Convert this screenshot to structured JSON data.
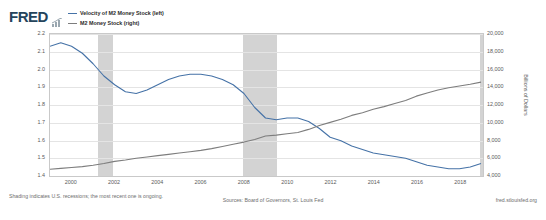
{
  "brand": {
    "logo_text": "FRED",
    "mark_icon": "bar-chart-icon"
  },
  "legend": {
    "position": "top-left",
    "items": [
      {
        "label": "Velocity of M2 Money Stock (left)",
        "color": "#4572a7"
      },
      {
        "label": "M2 Money Stock (right)",
        "color": "#7d7d7d"
      }
    ]
  },
  "footer": {
    "note": "Shading indicates U.S. recessions; the most recent one is ongoing.",
    "sources": "Sources: Board of Governors, St. Louis Fed",
    "url": "fred.stlouisfed.org"
  },
  "chart_data": {
    "type": "line",
    "title": "",
    "xlabel": "",
    "grid": true,
    "xlim": [
      1999.0,
      2019.0
    ],
    "x_ticks": [
      "2000",
      "2002",
      "2004",
      "2006",
      "2008",
      "2010",
      "2012",
      "2014",
      "2016",
      "2018"
    ],
    "x_tick_values": [
      2000,
      2002,
      2004,
      2006,
      2008,
      2010,
      2012,
      2014,
      2016,
      2018
    ],
    "axes": [
      {
        "side": "left",
        "ylabel": "Ratio",
        "ylim": [
          1.4,
          2.2
        ],
        "ticks": [
          "2.2",
          "2.1",
          "2.0",
          "1.9",
          "1.8",
          "1.7",
          "1.6",
          "1.5",
          "1.4"
        ],
        "tick_values": [
          2.2,
          2.1,
          2.0,
          1.9,
          1.8,
          1.7,
          1.6,
          1.5,
          1.4
        ]
      },
      {
        "side": "right",
        "ylabel": "Billions of Dollars",
        "ylim": [
          4000,
          20000
        ],
        "ticks": [
          "20,000",
          "18,000",
          "16,000",
          "14,000",
          "12,000",
          "10,000",
          "8,000",
          "6,000",
          "4,000"
        ],
        "tick_values": [
          20000,
          18000,
          16000,
          14000,
          12000,
          10000,
          8000,
          6000,
          4000
        ]
      }
    ],
    "series": [
      {
        "name": "Velocity of M2 Money Stock (left)",
        "axis": "left",
        "color": "#4572a7",
        "x": [
          1999.0,
          1999.5,
          2000.0,
          2000.5,
          2001.0,
          2001.5,
          2002.0,
          2002.5,
          2003.0,
          2003.5,
          2004.0,
          2004.5,
          2005.0,
          2005.5,
          2006.0,
          2006.5,
          2007.0,
          2007.5,
          2008.0,
          2008.5,
          2009.0,
          2009.5,
          2010.0,
          2010.5,
          2011.0,
          2011.5,
          2012.0,
          2012.5,
          2013.0,
          2013.5,
          2014.0,
          2014.5,
          2015.0,
          2015.5,
          2016.0,
          2016.5,
          2017.0,
          2017.5,
          2018.0,
          2018.5,
          2019.0
        ],
        "y": [
          2.13,
          2.15,
          2.13,
          2.09,
          2.03,
          1.96,
          1.91,
          1.87,
          1.86,
          1.88,
          1.91,
          1.94,
          1.96,
          1.97,
          1.97,
          1.96,
          1.94,
          1.91,
          1.86,
          1.78,
          1.72,
          1.71,
          1.72,
          1.72,
          1.7,
          1.66,
          1.61,
          1.59,
          1.56,
          1.54,
          1.52,
          1.51,
          1.5,
          1.49,
          1.47,
          1.45,
          1.44,
          1.43,
          1.43,
          1.44,
          1.46
        ]
      },
      {
        "name": "M2 Money Stock (right)",
        "axis": "right",
        "color": "#7d7d7d",
        "x": [
          1999.0,
          1999.5,
          2000.0,
          2000.5,
          2001.0,
          2001.5,
          2002.0,
          2002.5,
          2003.0,
          2003.5,
          2004.0,
          2004.5,
          2005.0,
          2005.5,
          2006.0,
          2006.5,
          2007.0,
          2007.5,
          2008.0,
          2008.5,
          2009.0,
          2009.5,
          2010.0,
          2010.5,
          2011.0,
          2011.5,
          2012.0,
          2012.5,
          2013.0,
          2013.5,
          2014.0,
          2014.5,
          2015.0,
          2015.5,
          2016.0,
          2016.5,
          2017.0,
          2017.5,
          2018.0,
          2018.5,
          2019.0
        ],
        "y": [
          4550,
          4650,
          4750,
          4850,
          5000,
          5200,
          5450,
          5600,
          5800,
          5950,
          6100,
          6250,
          6400,
          6550,
          6700,
          6900,
          7150,
          7400,
          7650,
          7950,
          8350,
          8450,
          8600,
          8750,
          9100,
          9550,
          9900,
          10250,
          10700,
          11000,
          11400,
          11700,
          12050,
          12400,
          12900,
          13250,
          13600,
          13850,
          14050,
          14250,
          14500
        ]
      }
    ],
    "recession_bands": [
      {
        "start": 2001.2,
        "end": 2001.9,
        "color": "#d3d3d3"
      },
      {
        "start": 2007.9,
        "end": 2009.5,
        "color": "#d3d3d3"
      },
      {
        "start": 2018.85,
        "end": 2019.0,
        "color": "#d3d3d3"
      }
    ]
  }
}
